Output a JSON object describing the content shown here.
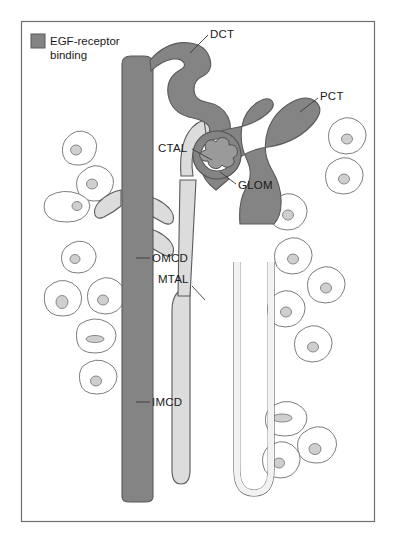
{
  "figure": {
    "frame": {
      "stroke": "#6f6f6f"
    },
    "background": "#ffffff"
  },
  "legend": {
    "swatch_name": "egf-receptor-binding-swatch",
    "swatch_color": "#848484",
    "label_line1": "EGF-receptor",
    "label_line2": "binding"
  },
  "colors": {
    "dark_tubule": "#848484",
    "light_tubule": "#dcdcdc",
    "outline": "#595959",
    "cell_fill": "#ffffff",
    "cell_stroke": "#7d7d7d",
    "nucleus_fill": "#cfcfcf",
    "text": "#1a1a1a"
  },
  "labels": [
    {
      "id": "dct",
      "text": "DCT",
      "x": 210,
      "y": 38,
      "anchor": "start"
    },
    {
      "id": "pct",
      "text": "PCT",
      "x": 320,
      "y": 100,
      "anchor": "start"
    },
    {
      "id": "ctal",
      "text": "CTAL",
      "x": 158,
      "y": 152,
      "anchor": "start"
    },
    {
      "id": "glom",
      "text": "GLOM",
      "x": 238,
      "y": 189,
      "anchor": "start"
    },
    {
      "id": "omcd",
      "text": "OMCD",
      "x": 152,
      "y": 262,
      "anchor": "start"
    },
    {
      "id": "mtal",
      "text": "MTAL",
      "x": 158,
      "y": 283,
      "anchor": "start"
    },
    {
      "id": "imcd",
      "text": "IMCD",
      "x": 152,
      "y": 406,
      "anchor": "start"
    }
  ],
  "structures": [
    {
      "id": "collecting-duct",
      "name": "collecting-duct",
      "shading": "EGF-receptor binding"
    },
    {
      "id": "collecting-duct-branches",
      "name": "collecting-duct-branches",
      "shading": "none"
    },
    {
      "id": "distal-convoluted-tubule",
      "name": "distal-convoluted-tubule",
      "shading": "EGF-receptor binding"
    },
    {
      "id": "proximal-convoluted-tubule",
      "name": "proximal-convoluted-tubule",
      "shading": "EGF-receptor binding"
    },
    {
      "id": "cortical-thick-ascending-limb",
      "name": "cortical-thick-ascending-limb",
      "shading": "none"
    },
    {
      "id": "medullary-thick-ascending-limb",
      "name": "medullary-thick-ascending-limb",
      "shading": "none"
    },
    {
      "id": "descending-limb",
      "name": "descending-limb",
      "shading": "none"
    },
    {
      "id": "loop-of-henle",
      "name": "loop-of-henle",
      "shading": "none"
    },
    {
      "id": "glomerulus",
      "name": "glomerulus",
      "shading": "EGF-receptor binding"
    }
  ]
}
